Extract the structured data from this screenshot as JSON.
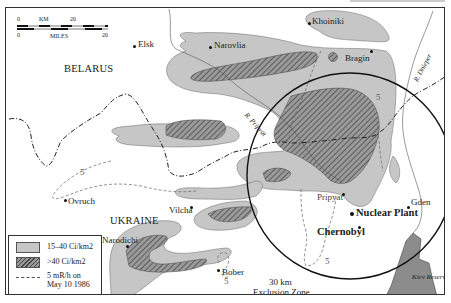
{
  "map": {
    "countries": [
      "BELARUS",
      "UKRAINE"
    ],
    "towns": [
      {
        "name": "Elsk"
      },
      {
        "name": "Khoiniki"
      },
      {
        "name": "Narovlia"
      },
      {
        "name": "Bragin"
      },
      {
        "name": "Ovruch"
      },
      {
        "name": "Vilcha"
      },
      {
        "name": "Narodichi"
      },
      {
        "name": "Pripyat"
      },
      {
        "name": "Gden"
      },
      {
        "name": "Bober"
      }
    ],
    "key_sites": {
      "plant": "Nuclear Plant",
      "city": "Chernobyl"
    },
    "rivers": {
      "pripyat": "R. Pripyat",
      "dnieper": "R. Dnieper"
    },
    "water": {
      "reservoir": "Kiev Reservoir"
    },
    "zone": {
      "label_line1": "30 km",
      "label_line2": "Exclusion Zone"
    },
    "contour_labels": [
      "5",
      "5",
      "5",
      "5"
    ],
    "scale_bar": {
      "km_label": "KM",
      "miles_label": "MILES",
      "km_start": "0",
      "km_end": "20",
      "miles_start": "0",
      "miles_end": "20"
    },
    "legend": {
      "items": [
        {
          "swatch": "light-gray",
          "label": "15–40 Ci/km2"
        },
        {
          "swatch": "hatched",
          "label": ">40 Ci/km2"
        },
        {
          "swatch": "dashed-line",
          "label_line1": "5 mR/h on",
          "label_line2": "May 10 1986"
        }
      ]
    },
    "colors": {
      "contamination_light": "#c6c6c6",
      "contamination_heavy_hatch": "#555555",
      "reservoir": "#8c8c8c",
      "border_line": "#222222"
    }
  }
}
